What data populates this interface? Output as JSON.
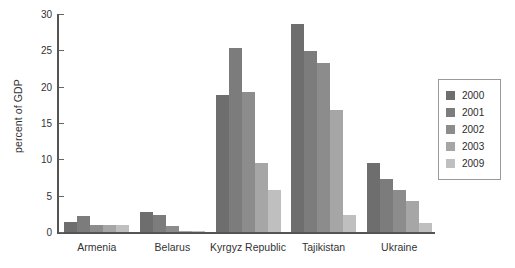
{
  "chart_data": {
    "type": "bar",
    "title": "",
    "xlabel": "",
    "ylabel": "percent of GDP",
    "ylim": [
      0,
      30
    ],
    "yticks": [
      0,
      5,
      10,
      15,
      20,
      25,
      30
    ],
    "grid": false,
    "legend_position": "right",
    "categories": [
      "Armenia",
      "Belarus",
      "Kyrgyz Republic",
      "Tajikistan",
      "Ukraine"
    ],
    "series": [
      {
        "name": "2000",
        "color": "#6e6e6e",
        "values": [
          1.4,
          2.7,
          18.9,
          28.6,
          9.5
        ]
      },
      {
        "name": "2001",
        "color": "#7c7c7c",
        "values": [
          2.2,
          2.4,
          25.3,
          24.9,
          7.3
        ]
      },
      {
        "name": "2002",
        "color": "#8c8c8c",
        "values": [
          1.0,
          0.8,
          19.3,
          23.2,
          5.8
        ]
      },
      {
        "name": "2003",
        "color": "#a6a6a6",
        "values": [
          1.0,
          0.15,
          9.5,
          16.8,
          4.3
        ]
      },
      {
        "name": "2009",
        "color": "#bfbfbf",
        "values": [
          1.0,
          0.1,
          5.8,
          2.3,
          1.2
        ]
      }
    ]
  },
  "axis": {
    "y_title": "percent of GDP",
    "tick_labels": [
      "0",
      "5",
      "10",
      "15",
      "20",
      "25",
      "30"
    ]
  },
  "legend": {
    "entries": [
      {
        "label": "2000"
      },
      {
        "label": "2001"
      },
      {
        "label": "2002"
      },
      {
        "label": "2003"
      },
      {
        "label": "2009"
      }
    ]
  }
}
